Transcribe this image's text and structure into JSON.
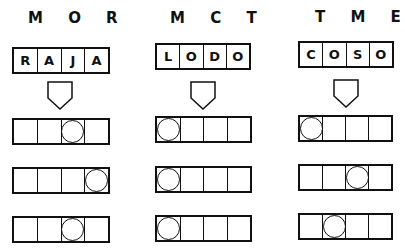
{
  "columns": [
    {
      "header": "M O R",
      "word": [
        "R",
        "A",
        "J",
        "A"
      ],
      "rows": [
        {
          "circle_index": 2
        },
        {
          "circle_index": 3
        },
        {
          "circle_index": 2
        }
      ]
    },
    {
      "header": "M C T",
      "word": [
        "L",
        "O",
        "D",
        "O"
      ],
      "rows": [
        {
          "circle_index": 0
        },
        {
          "circle_index": 0
        },
        {
          "circle_index": 0
        }
      ]
    },
    {
      "header": "T M E",
      "word": [
        "C",
        "O",
        "S",
        "O"
      ],
      "rows": [
        {
          "circle_index": 0
        },
        {
          "circle_index": 2
        },
        {
          "circle_index": 1
        }
      ]
    }
  ],
  "colors": {
    "ink": "#111111",
    "background": "#ffffff"
  }
}
